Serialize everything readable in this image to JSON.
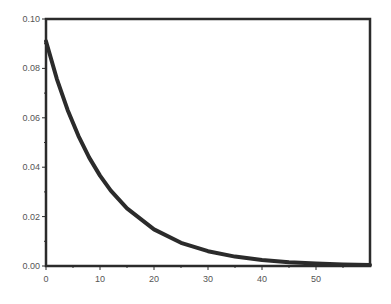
{
  "chart_data": {
    "type": "line",
    "title": "",
    "xlabel": "",
    "ylabel": "",
    "xlim": [
      0,
      60
    ],
    "ylim": [
      0,
      0.1
    ],
    "grid": false,
    "legend": null,
    "x_ticks": [
      0,
      10,
      20,
      30,
      40,
      50
    ],
    "x_tick_labels": [
      "0",
      "10",
      "20",
      "30",
      "40",
      "50"
    ],
    "y_ticks": [
      0,
      0.02,
      0.04,
      0.06,
      0.08,
      0.1
    ],
    "y_tick_labels": [
      "0.00",
      "0.02",
      "0.04",
      "0.06",
      "0.08",
      "0.10"
    ],
    "series": [
      {
        "name": "decay",
        "description": "exponential decay approx 0.091*exp(-x/11)",
        "x": [
          0,
          2,
          4,
          6,
          8,
          10,
          12,
          15,
          20,
          25,
          30,
          35,
          40,
          45,
          50,
          55,
          60
        ],
        "y": [
          0.091,
          0.0758,
          0.0632,
          0.0527,
          0.0439,
          0.0366,
          0.0305,
          0.0233,
          0.0148,
          0.0094,
          0.006,
          0.0038,
          0.0024,
          0.0015,
          0.001,
          0.0006,
          0.0004
        ]
      }
    ],
    "colors": {
      "line": "#2b2b2b",
      "axes": "#2b2b2b",
      "text": "#555555",
      "background": "#ffffff"
    }
  }
}
